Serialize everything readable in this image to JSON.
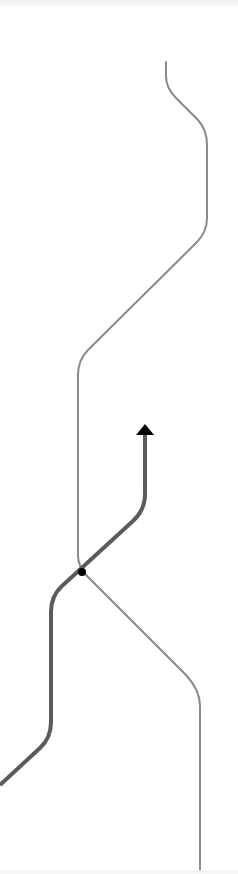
{
  "diagram": {
    "type": "route-maneuver",
    "colors": {
      "background": "#ffffff",
      "other_road": "#8a8a8a",
      "active_route": "#5b5b5b",
      "arrow": "#000000",
      "junction_dot": "#000000"
    },
    "other_road": {
      "stroke_width": 2,
      "path": "M166 62 L166 76 Q166 88 176 98 L198 120 Q207 130 207 145 L207 218 Q207 232 197 242 L88 350 Q78 360 78 375 L78 555 Q78 566 86 575 L186 675 Q200 690 200 706 L200 874"
    },
    "active_route": {
      "stroke_width": 4,
      "path": "M0 785 L40 748 Q51 738 51 722 L51 612 Q51 596 62 586 L133 521 Q145 510 145 494 L145 434"
    },
    "arrow": {
      "tip_x": 145,
      "tip_y": 424,
      "half_width": 9,
      "height": 11
    },
    "junction": {
      "cx": 82,
      "cy": 572,
      "r": 4
    }
  }
}
